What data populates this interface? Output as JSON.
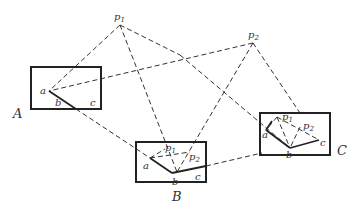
{
  "diagram": {
    "type": "geometric-construction",
    "points": {
      "p1": {
        "label": "p",
        "sub": "1"
      },
      "p2": {
        "label": "p",
        "sub": "2"
      }
    },
    "frames": [
      {
        "name": "A",
        "labels": {
          "a": "a",
          "b": "b",
          "c": "c"
        }
      },
      {
        "name": "B",
        "labels": {
          "a": "a",
          "b": "b",
          "c": "c",
          "p1": "p",
          "p1_sub": "1",
          "p2": "p",
          "p2_sub": "2"
        }
      },
      {
        "name": "C",
        "labels": {
          "a": "a",
          "b": "b",
          "c": "c",
          "p1": "p",
          "p1_sub": "1",
          "p2": "p",
          "p2_sub": "2"
        }
      }
    ],
    "colors": {
      "line": "#222222",
      "background": "#ffffff"
    }
  }
}
